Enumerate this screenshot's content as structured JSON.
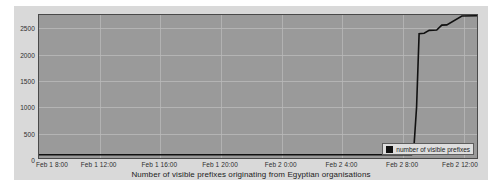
{
  "chart_data": {
    "type": "line",
    "title": "",
    "xlabel": "Number of visible prefixes originating from Egyptian organisations",
    "ylabel": "",
    "grid": true,
    "legend_position": "bottom-right",
    "ylim": [
      0,
      2750
    ],
    "yticks": [
      0,
      500,
      1000,
      1500,
      2000,
      2500
    ],
    "ytick_labels": [
      "0",
      "500",
      "1000",
      "1500",
      "2000",
      "2500"
    ],
    "xlim": [
      "Feb 1 8:00",
      "Feb 2 13:00"
    ],
    "xticks": [
      "Feb 1 8:00",
      "Feb 1 12:00",
      "Feb 1 16:00",
      "Feb 1 20:00",
      "Feb 2 0:00",
      "Feb 2 4:00",
      "Feb 2 8:00",
      "Feb 2 12:00"
    ],
    "series": [
      {
        "name": "number of visible prefixes",
        "color": "#111111",
        "x": [
          "Feb 1 8:00",
          "Feb 1 12:00",
          "Feb 1 16:00",
          "Feb 1 20:00",
          "Feb 2 0:00",
          "Feb 2 4:00",
          "Feb 2 8:00",
          "Feb 2 8:40",
          "Feb 2 8:50",
          "Feb 2 9:00",
          "Feb 2 9:10",
          "Feb 2 9:30",
          "Feb 2 9:50",
          "Feb 2 10:20",
          "Feb 2 10:40",
          "Feb 2 11:00",
          "Feb 2 12:00",
          "Feb 2 13:00"
        ],
        "values": [
          62,
          62,
          62,
          62,
          62,
          62,
          62,
          62,
          250,
          980,
          2390,
          2400,
          2455,
          2460,
          2555,
          2560,
          2730,
          2735
        ]
      }
    ],
    "annotations": []
  },
  "legend": {
    "entries": [
      {
        "label": "number of visible prefixes",
        "swatch_color": "#111111"
      }
    ]
  },
  "colors": {
    "canvas": "#ffffff",
    "card": "#d9d9d9",
    "plot_area": "#9a9a9a",
    "plot_border": "#4a4a4a",
    "gridline": "#b9b9b9",
    "series": "#111111",
    "tick_text": "#2e2e2e",
    "title_text": "#1c1c1c",
    "legend_background": "#dedede",
    "legend_border": "#5d5d5d"
  }
}
